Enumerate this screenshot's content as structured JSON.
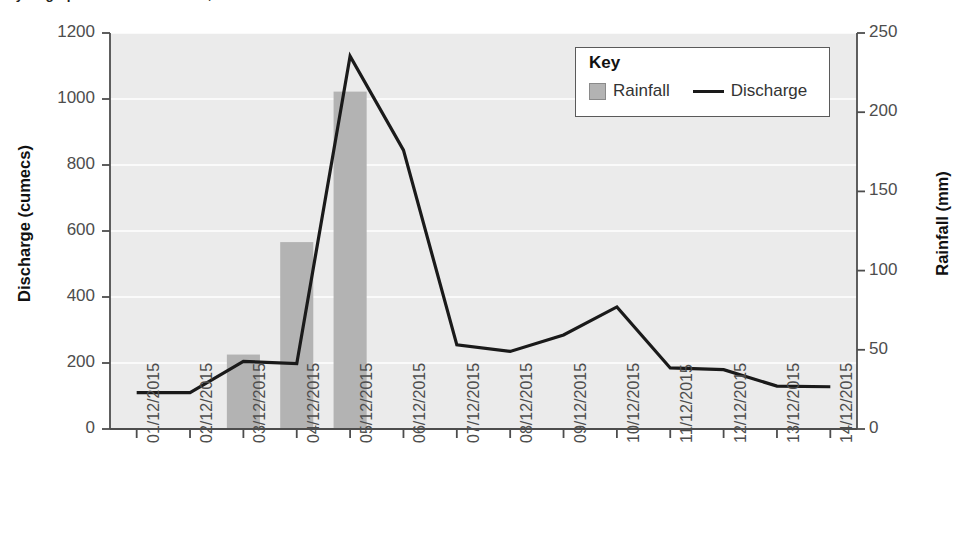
{
  "title": "Hydrograph for the River Greta, Keswick",
  "legend": {
    "title": "Key",
    "bar_label": "Rainfall",
    "line_label": "Discharge",
    "bar_swatch_icon": "filled-square-icon",
    "line_swatch_icon": "horizontal-line-icon"
  },
  "colors": {
    "bar_fill": "#b3b3b3",
    "line_stroke": "#1a1a1a",
    "plot_background": "#ebebeb",
    "gridline": "#ffffff",
    "axis": "#4d4d4d",
    "text": "#231f20"
  },
  "chart_data": {
    "type": "bar",
    "title": "Hydrograph for the River Greta, Keswick",
    "xlabel": "",
    "ylabel": "Discharge (cumecs)",
    "y2label": "Rainfall (mm)",
    "ylim": [
      0,
      1200
    ],
    "y2lim": [
      0,
      250
    ],
    "yticks": [
      0,
      200,
      400,
      600,
      800,
      1000,
      1200
    ],
    "y2ticks": [
      0,
      50,
      100,
      150,
      200,
      250
    ],
    "grid": true,
    "legend_position": "top-right",
    "categories": [
      "01/12/2015",
      "02/12/2015",
      "03/12/2015",
      "04/12/2015",
      "05/12/2015",
      "06/12/2015",
      "07/12/2015",
      "08/12/2015",
      "09/12/2015",
      "10/12/2015",
      "11/12/2015",
      "12/12/2015",
      "13/12/2015",
      "14/12/2015"
    ],
    "series": [
      {
        "name": "Rainfall",
        "type": "bar",
        "axis": "right",
        "unit": "mm",
        "values": [
          0,
          0,
          47,
          118,
          213,
          0,
          0,
          0,
          0,
          0,
          0,
          0,
          0,
          0
        ]
      },
      {
        "name": "Discharge",
        "type": "line",
        "axis": "left",
        "unit": "cumecs",
        "values": [
          110,
          110,
          205,
          198,
          1130,
          845,
          255,
          235,
          285,
          370,
          185,
          180,
          130,
          128
        ]
      }
    ]
  }
}
